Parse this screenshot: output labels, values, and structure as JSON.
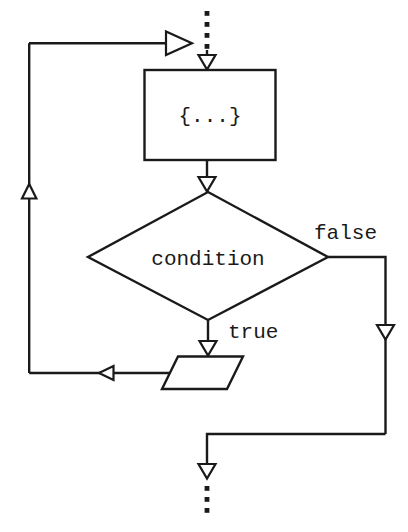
{
  "diagram": {
    "colors": {
      "stroke": "#1a1a1a",
      "fill": "#ffffff",
      "background": "#ffffff"
    },
    "nodes": {
      "body_block": {
        "label": "{...}",
        "shape": "rectangle"
      },
      "decision": {
        "label": "condition",
        "shape": "diamond"
      },
      "loop_action": {
        "label": "",
        "shape": "parallelogram"
      }
    },
    "edge_labels": {
      "false_branch": "false",
      "true_branch": "true"
    },
    "entry": {
      "style": "dotted",
      "label": ""
    },
    "exit": {
      "style": "dotted",
      "label": ""
    }
  }
}
